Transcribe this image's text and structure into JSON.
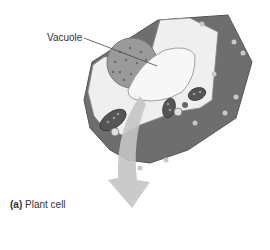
{
  "figure": {
    "labels": {
      "vacuole": "Vacuole"
    },
    "caption": {
      "prefix": "(a)",
      "text": "Plant cell"
    }
  },
  "colors": {
    "cell_wall": "#6e6e6e",
    "cell_wall_top": "#7a7a7a",
    "cytoplasm": "#efefef",
    "vacuole": "#f7f7f7",
    "nucleus": "#9a9a9a",
    "chloroplast": "#555555",
    "arrow": "#c4c4c4",
    "text": "#333333"
  }
}
